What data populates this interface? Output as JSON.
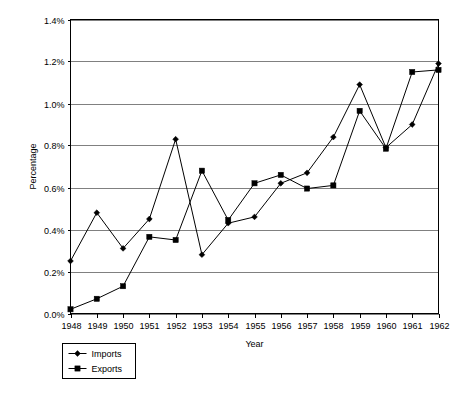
{
  "chart_data": {
    "type": "line",
    "title": "",
    "xlabel": "Year",
    "ylabel": "Percentage",
    "categories": [
      1948,
      1949,
      1950,
      1951,
      1952,
      1953,
      1954,
      1955,
      1956,
      1957,
      1958,
      1959,
      1960,
      1961,
      1962
    ],
    "x_tick_labels": [
      "1948",
      "1949",
      "1950",
      "1951",
      "1952",
      "1953",
      "1954",
      "1955",
      "1956",
      "1957",
      "1958",
      "1959",
      "1960",
      "1961",
      "1962"
    ],
    "y_tick_labels": [
      "0.0%",
      "0.2%",
      "0.4%",
      "0.6%",
      "0.8%",
      "1.0%",
      "1.2%",
      "1.4%"
    ],
    "y_tick_values": [
      0.0,
      0.2,
      0.4,
      0.6,
      0.8,
      1.0,
      1.2,
      1.4
    ],
    "ylim": [
      0.0,
      1.4
    ],
    "xlim": [
      1948,
      1962
    ],
    "grid": "horizontal",
    "legend_position": "below-left",
    "series": [
      {
        "name": "Imports",
        "marker": "diamond",
        "values": [
          0.25,
          0.48,
          0.31,
          0.45,
          0.83,
          0.28,
          0.43,
          0.46,
          0.62,
          0.67,
          0.84,
          1.09,
          0.79,
          0.9,
          1.19
        ]
      },
      {
        "name": "Exports",
        "marker": "square",
        "values": [
          0.02,
          0.07,
          0.13,
          0.365,
          0.35,
          0.68,
          0.445,
          0.62,
          0.66,
          0.595,
          0.61,
          0.965,
          0.785,
          1.15,
          1.16
        ]
      }
    ]
  },
  "legend": {
    "items": [
      {
        "label": "Imports",
        "marker": "diamond"
      },
      {
        "label": "Exports",
        "marker": "square"
      }
    ]
  },
  "colors": {
    "line": "#000000",
    "grid": "#808080",
    "border": "#000000",
    "background": "#ffffff",
    "text": "#000000"
  }
}
